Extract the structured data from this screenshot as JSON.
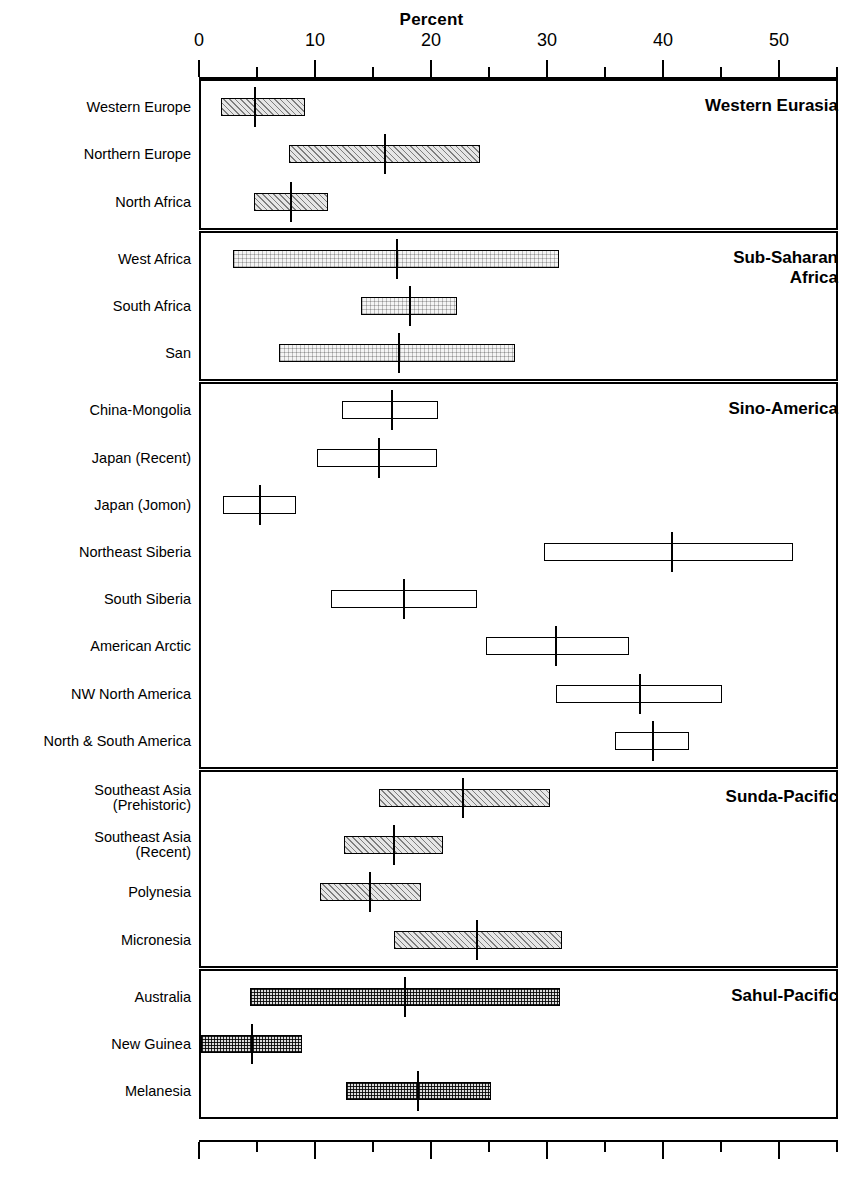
{
  "chart_data": {
    "type": "bar",
    "title": "Percent",
    "xlabel": "Percent",
    "ylabel": "",
    "xlim": [
      0,
      55
    ],
    "xticks_major": [
      0,
      10,
      20,
      30,
      40,
      50
    ],
    "xtick_labels": [
      "0",
      "10",
      "20",
      "30",
      "40",
      "50"
    ],
    "xticks_minor": [
      5,
      15,
      25,
      35,
      45,
      55
    ],
    "grid": false,
    "legend": "none",
    "groups": [
      {
        "name": "Western Eurasia",
        "fill": "hatch",
        "rows": [
          {
            "label": "Western Europe",
            "low": 1.9,
            "high": 9.1,
            "mean": 4.8
          },
          {
            "label": "Northern Europe",
            "low": 7.8,
            "high": 24.2,
            "mean": 16.0
          },
          {
            "label": "North Africa",
            "low": 4.7,
            "high": 11.1,
            "mean": 7.9
          }
        ]
      },
      {
        "name": "Sub-Saharan\nAfrica",
        "fill": "lightgrid",
        "rows": [
          {
            "label": "West Africa",
            "low": 2.9,
            "high": 31.0,
            "mean": 17.1
          },
          {
            "label": "South Africa",
            "low": 14.0,
            "high": 22.2,
            "mean": 18.2
          },
          {
            "label": "San",
            "low": 6.9,
            "high": 27.2,
            "mean": 17.2
          }
        ]
      },
      {
        "name": "Sino-America",
        "fill": "open",
        "rows": [
          {
            "label": "China-Mongolia",
            "low": 12.3,
            "high": 20.6,
            "mean": 16.6
          },
          {
            "label": "Japan (Recent)",
            "low": 10.2,
            "high": 20.5,
            "mean": 15.5
          },
          {
            "label": "Japan (Jomon)",
            "low": 2.1,
            "high": 8.4,
            "mean": 5.3
          },
          {
            "label": "Northeast Siberia",
            "low": 29.7,
            "high": 51.2,
            "mean": 40.8
          },
          {
            "label": "South Siberia",
            "low": 11.4,
            "high": 24.0,
            "mean": 17.7
          },
          {
            "label": "American Arctic",
            "low": 24.7,
            "high": 37.1,
            "mean": 30.8
          },
          {
            "label": "NW North America",
            "low": 30.8,
            "high": 45.1,
            "mean": 38.0
          },
          {
            "label": "North & South America",
            "low": 35.9,
            "high": 42.2,
            "mean": 39.1
          }
        ]
      },
      {
        "name": "Sunda-Pacific",
        "fill": "hatch",
        "rows": [
          {
            "label": "Southeast Asia\n(Prehistoric)",
            "low": 15.5,
            "high": 30.3,
            "mean": 22.8
          },
          {
            "label": "Southeast Asia\n(Recent)",
            "low": 12.5,
            "high": 21.0,
            "mean": 16.8
          },
          {
            "label": "Polynesia",
            "low": 10.4,
            "high": 19.1,
            "mean": 14.7
          },
          {
            "label": "Micronesia",
            "low": 16.8,
            "high": 31.3,
            "mean": 24.0
          }
        ]
      },
      {
        "name": "Sahul-Pacific",
        "fill": "grid",
        "rows": [
          {
            "label": "Australia",
            "low": 4.4,
            "high": 31.1,
            "mean": 17.8
          },
          {
            "label": "New Guinea",
            "low": 0.2,
            "high": 8.9,
            "mean": 4.6
          },
          {
            "label": "Melanesia",
            "low": 12.7,
            "high": 25.2,
            "mean": 18.9
          }
        ]
      }
    ]
  }
}
